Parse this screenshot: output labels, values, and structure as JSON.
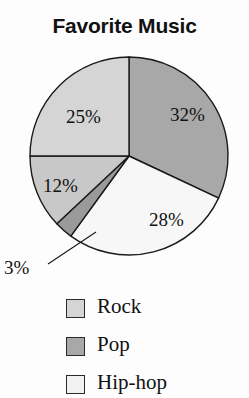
{
  "chart_data": {
    "type": "pie",
    "title": "Favorite Music",
    "xlabel": "",
    "ylabel": "",
    "legend_position": "bottom",
    "grid": false,
    "start_angle_deg": 0,
    "direction": "clockwise",
    "categories": [
      "Pop",
      "Hip-hop",
      "Rock",
      "Rock",
      "Rock"
    ],
    "values": [
      32,
      28,
      3,
      12,
      25
    ],
    "slices": [
      {
        "label": "32%",
        "value": 32,
        "color": "#a8a8a8",
        "label_placement": "inside",
        "label_x": 170,
        "label_y": 121
      },
      {
        "label": "28%",
        "value": 28,
        "color": "#f7f7f7",
        "label_placement": "inside",
        "label_x": 149,
        "label_y": 226
      },
      {
        "label": "3%",
        "value": 3,
        "color": "#9a9a9a",
        "label_placement": "outside",
        "label_x": 4,
        "label_y": 274
      },
      {
        "label": "12%",
        "value": 12,
        "color": "#c8c8c8",
        "label_placement": "inside",
        "label_x": 43,
        "label_y": 192
      },
      {
        "label": "25%",
        "value": 25,
        "color": "#d5d5d5",
        "label_placement": "inside",
        "label_x": 66,
        "label_y": 123
      }
    ],
    "outline_color": "#1a1a1a",
    "center_x": 129,
    "center_y": 156,
    "radius": 99
  },
  "title": "Favorite Music",
  "legend": {
    "items": [
      {
        "label": "Rock",
        "color": "#d5d5d5"
      },
      {
        "label": "Pop",
        "color": "#a8a8a8"
      },
      {
        "label": "Hip-hop",
        "color": "#f2f2f2"
      }
    ]
  }
}
